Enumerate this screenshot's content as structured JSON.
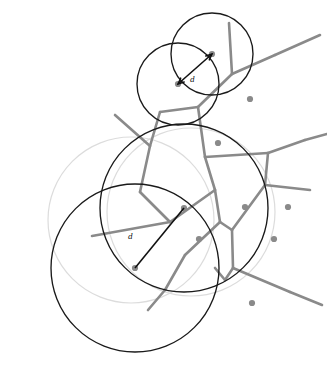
{
  "figure": {
    "width": 327,
    "height": 376,
    "background_color": "#ffffff"
  },
  "colors": {
    "voronoi_edge": "#8a8a8a",
    "site_dot": "#8a8a8a",
    "circle_black": "#1a1a1a",
    "circle_faint": "#dcdcdc",
    "distance_marker": "#111111"
  },
  "labels": {
    "upper_distance": "d",
    "lower_distance": "d"
  },
  "chart_data": {
    "type": "scatter",
    "xlabel": "",
    "ylabel": "",
    "xlim": [
      0,
      327
    ],
    "ylim": [
      0,
      376
    ],
    "grid": false,
    "legend": "none",
    "sites": [
      {
        "id": "s1",
        "x": 212,
        "y": 54
      },
      {
        "id": "s2",
        "x": 178,
        "y": 84
      },
      {
        "id": "s3",
        "x": 250,
        "y": 99
      },
      {
        "id": "s4",
        "x": 218,
        "y": 143
      },
      {
        "id": "s5",
        "x": 184,
        "y": 208
      },
      {
        "id": "s6",
        "x": 245,
        "y": 207
      },
      {
        "id": "s7",
        "x": 288,
        "y": 207
      },
      {
        "id": "s8",
        "x": 135,
        "y": 268
      },
      {
        "id": "s9",
        "x": 199,
        "y": 239
      },
      {
        "id": "s10",
        "x": 274,
        "y": 239
      },
      {
        "id": "s11",
        "x": 252,
        "y": 303
      }
    ],
    "circles": [
      {
        "id": "c1",
        "cx": 212,
        "cy": 54,
        "r": 41,
        "style": "black",
        "center_site": "s1"
      },
      {
        "id": "c2",
        "cx": 178,
        "cy": 84,
        "r": 41,
        "style": "black",
        "center_site": "s2"
      },
      {
        "id": "c3",
        "cx": 135,
        "cy": 268,
        "r": 84,
        "style": "black",
        "center_site": "s8"
      },
      {
        "id": "c4",
        "cx": 184,
        "cy": 208,
        "r": 84,
        "style": "black",
        "center_site": "s5"
      },
      {
        "id": "c5",
        "cx": 131,
        "cy": 220,
        "r": 83,
        "style": "faint"
      },
      {
        "id": "c6",
        "cx": 191,
        "cy": 212,
        "r": 84,
        "style": "faint"
      }
    ],
    "distance_markers": [
      {
        "label": "d",
        "from": [
          178,
          84
        ],
        "to": [
          212,
          54
        ],
        "arrow": "double",
        "label_pos": [
          190,
          82
        ]
      },
      {
        "label": "d",
        "from": [
          135,
          268
        ],
        "to": [
          184,
          208
        ],
        "arrow": "none",
        "label_pos": [
          128,
          239
        ]
      }
    ],
    "voronoi_edges": [
      [
        [
          229,
          23
        ],
        [
          232,
          74
        ]
      ],
      [
        [
          232,
          74
        ],
        [
          198,
          107
        ]
      ],
      [
        [
          198,
          107
        ],
        [
          160,
          112
        ]
      ],
      [
        [
          232,
          74
        ],
        [
          275,
          55
        ]
      ],
      [
        [
          275,
          55
        ],
        [
          320,
          35
        ]
      ],
      [
        [
          198,
          107
        ],
        [
          205,
          157
        ]
      ],
      [
        [
          160,
          112
        ],
        [
          150,
          146
        ]
      ],
      [
        [
          150,
          146
        ],
        [
          115,
          115
        ]
      ],
      [
        [
          205,
          157
        ],
        [
          268,
          153
        ]
      ],
      [
        [
          268,
          153
        ],
        [
          305,
          140
        ]
      ],
      [
        [
          305,
          140
        ],
        [
          327,
          134
        ]
      ],
      [
        [
          268,
          153
        ],
        [
          265,
          185
        ]
      ],
      [
        [
          205,
          157
        ],
        [
          215,
          190
        ]
      ],
      [
        [
          215,
          190
        ],
        [
          220,
          222
        ]
      ],
      [
        [
          150,
          146
        ],
        [
          140,
          192
        ]
      ],
      [
        [
          140,
          192
        ],
        [
          170,
          222
        ]
      ],
      [
        [
          170,
          222
        ],
        [
          215,
          190
        ]
      ],
      [
        [
          170,
          222
        ],
        [
          92,
          236
        ]
      ],
      [
        [
          265,
          185
        ],
        [
          310,
          190
        ]
      ],
      [
        [
          265,
          185
        ],
        [
          232,
          230
        ]
      ],
      [
        [
          232,
          230
        ],
        [
          220,
          222
        ]
      ],
      [
        [
          232,
          230
        ],
        [
          233,
          268
        ]
      ],
      [
        [
          233,
          268
        ],
        [
          225,
          280
        ]
      ],
      [
        [
          225,
          280
        ],
        [
          215,
          268
        ]
      ],
      [
        [
          233,
          268
        ],
        [
          290,
          292
        ]
      ],
      [
        [
          290,
          292
        ],
        [
          322,
          305
        ]
      ],
      [
        [
          220,
          222
        ],
        [
          185,
          255
        ]
      ],
      [
        [
          185,
          255
        ],
        [
          165,
          290
        ]
      ],
      [
        [
          165,
          290
        ],
        [
          148,
          310
        ]
      ]
    ]
  }
}
